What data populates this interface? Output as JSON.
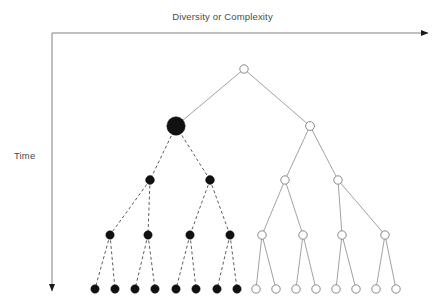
{
  "figure": {
    "type": "phylogenetic-tree-diagram",
    "background_color": "#ffffff",
    "width": 445,
    "height": 304
  },
  "axes": {
    "x_label": "Diversity or Complexity",
    "y_label": "Time",
    "label_color": "#4a4a4a",
    "axis_color": "#808080",
    "origin": {
      "x": 52,
      "y": 33
    },
    "x_arrow_end": {
      "x": 428,
      "y": 33
    },
    "y_arrow_end": {
      "x": 52,
      "y": 291
    }
  },
  "style": {
    "filled_node_color": "#111111",
    "open_node_stroke": "#8a8a8a",
    "open_node_fill": "#ffffff",
    "dashed_edge_color": "#333333",
    "solid_edge_color": "#8a8a8a",
    "dash_pattern": "3,2.5",
    "edge_width": 0.8
  },
  "tree": {
    "root": {
      "id": "root",
      "x": 244,
      "y": 69,
      "r": 4.2,
      "kind": "open"
    },
    "levels": [
      {
        "level": 1,
        "y": 69,
        "nodes": 1
      },
      {
        "level": 2,
        "y": 126,
        "nodes": 2
      },
      {
        "level": 3,
        "y": 180,
        "nodes": 4
      },
      {
        "level": 4,
        "y": 235,
        "nodes": 8
      },
      {
        "level": 5,
        "y": 289,
        "nodes": 16
      }
    ],
    "left_branch": {
      "name": "extinct-lineage",
      "edge_style": "dashed",
      "node_kind": "filled",
      "nodes": [
        {
          "id": "L0",
          "x": 176,
          "y": 126,
          "r": 9.2,
          "emphasis": "large"
        },
        {
          "id": "L1a",
          "x": 150,
          "y": 180,
          "r": 4.4
        },
        {
          "id": "L1b",
          "x": 210,
          "y": 180,
          "r": 4.4
        },
        {
          "id": "L2a",
          "x": 110,
          "y": 235,
          "r": 4.2
        },
        {
          "id": "L2b",
          "x": 148,
          "y": 235,
          "r": 4.2
        },
        {
          "id": "L2c",
          "x": 190,
          "y": 235,
          "r": 4.2
        },
        {
          "id": "L2d",
          "x": 230,
          "y": 235,
          "r": 4.2
        },
        {
          "id": "L3a",
          "x": 95,
          "y": 289,
          "r": 4.2
        },
        {
          "id": "L3b",
          "x": 115,
          "y": 289,
          "r": 4.2
        },
        {
          "id": "L3c",
          "x": 135,
          "y": 289,
          "r": 4.2
        },
        {
          "id": "L3d",
          "x": 155,
          "y": 289,
          "r": 4.2
        },
        {
          "id": "L3e",
          "x": 176,
          "y": 289,
          "r": 4.2
        },
        {
          "id": "L3f",
          "x": 196,
          "y": 289,
          "r": 4.2
        },
        {
          "id": "L3g",
          "x": 217,
          "y": 289,
          "r": 4.2
        },
        {
          "id": "L3h",
          "x": 237,
          "y": 289,
          "r": 4.2
        }
      ],
      "edges": [
        {
          "from": "L0",
          "to": "L1a"
        },
        {
          "from": "L0",
          "to": "L1b"
        },
        {
          "from": "L1a",
          "to": "L2a"
        },
        {
          "from": "L1a",
          "to": "L2b"
        },
        {
          "from": "L1b",
          "to": "L2c"
        },
        {
          "from": "L1b",
          "to": "L2d"
        },
        {
          "from": "L2a",
          "to": "L3a"
        },
        {
          "from": "L2a",
          "to": "L3b"
        },
        {
          "from": "L2b",
          "to": "L3c"
        },
        {
          "from": "L2b",
          "to": "L3d"
        },
        {
          "from": "L2c",
          "to": "L3e"
        },
        {
          "from": "L2c",
          "to": "L3f"
        },
        {
          "from": "L2d",
          "to": "L3g"
        },
        {
          "from": "L2d",
          "to": "L3h"
        }
      ]
    },
    "right_branch": {
      "name": "surviving-lineage",
      "edge_style": "solid",
      "node_kind": "open",
      "nodes": [
        {
          "id": "R0",
          "x": 310,
          "y": 126,
          "r": 4.4
        },
        {
          "id": "R1a",
          "x": 285,
          "y": 180,
          "r": 4.2
        },
        {
          "id": "R1b",
          "x": 338,
          "y": 180,
          "r": 4.2
        },
        {
          "id": "R2a",
          "x": 262,
          "y": 235,
          "r": 4.2
        },
        {
          "id": "R2b",
          "x": 303,
          "y": 235,
          "r": 4.2
        },
        {
          "id": "R2c",
          "x": 342,
          "y": 235,
          "r": 4.2
        },
        {
          "id": "R2d",
          "x": 385,
          "y": 235,
          "r": 4.2
        },
        {
          "id": "R3a",
          "x": 256,
          "y": 289,
          "r": 4.2
        },
        {
          "id": "R3b",
          "x": 276,
          "y": 289,
          "r": 4.2
        },
        {
          "id": "R3c",
          "x": 296,
          "y": 289,
          "r": 4.2
        },
        {
          "id": "R3d",
          "x": 316,
          "y": 289,
          "r": 4.2
        },
        {
          "id": "R3e",
          "x": 336,
          "y": 289,
          "r": 4.2
        },
        {
          "id": "R3f",
          "x": 356,
          "y": 289,
          "r": 4.2
        },
        {
          "id": "R3g",
          "x": 376,
          "y": 289,
          "r": 4.2
        },
        {
          "id": "R3h",
          "x": 396,
          "y": 289,
          "r": 4.2
        }
      ],
      "edges": [
        {
          "from": "R0",
          "to": "R1a"
        },
        {
          "from": "R0",
          "to": "R1b"
        },
        {
          "from": "R1a",
          "to": "R2a"
        },
        {
          "from": "R1a",
          "to": "R2b"
        },
        {
          "from": "R1b",
          "to": "R2c"
        },
        {
          "from": "R1b",
          "to": "R2d"
        },
        {
          "from": "R2a",
          "to": "R3a"
        },
        {
          "from": "R2a",
          "to": "R3b"
        },
        {
          "from": "R2b",
          "to": "R3c"
        },
        {
          "from": "R2b",
          "to": "R3d"
        },
        {
          "from": "R2c",
          "to": "R3e"
        },
        {
          "from": "R2c",
          "to": "R3f"
        },
        {
          "from": "R2d",
          "to": "R3g"
        },
        {
          "from": "R2d",
          "to": "R3h"
        }
      ]
    },
    "root_edges": [
      {
        "from": "root",
        "to": "L0",
        "style": "solid"
      },
      {
        "from": "root",
        "to": "R0",
        "style": "solid"
      }
    ]
  }
}
